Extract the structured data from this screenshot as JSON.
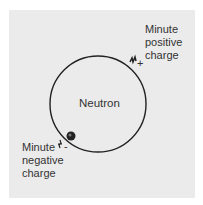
{
  "diagram": {
    "center_label": "Neutron",
    "positive_label": [
      "Minute",
      "positive",
      "charge"
    ],
    "negative_label": [
      "Minute",
      "negative",
      "charge"
    ],
    "positive_sign": "+",
    "negative_sign": "-",
    "colors": {
      "background": "#ebebeb",
      "outline": "#222222",
      "text": "#333333"
    }
  }
}
